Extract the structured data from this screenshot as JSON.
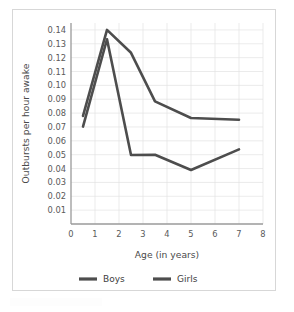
{
  "figure": {
    "border_color": "#d7d7d7",
    "background": "#ffffff"
  },
  "chart_data": {
    "type": "line",
    "title": "",
    "xlabel": "Age (in years)",
    "ylabel": "Outbursts per hour awake",
    "xlim": [
      0,
      8
    ],
    "ylim": [
      0,
      0.145
    ],
    "grid": true,
    "legend_position": "bottom",
    "x": [
      0.5,
      1.5,
      2.5,
      3.5,
      5,
      7
    ],
    "series": [
      {
        "name": "Boys",
        "color": "#4d4d4d",
        "values": [
          0.078,
          0.14,
          0.1235,
          0.0885,
          0.0765,
          0.0752
        ]
      },
      {
        "name": "Girls",
        "color": "#4d4d4d",
        "values": [
          0.0703,
          0.1333,
          0.0498,
          0.05,
          0.039,
          0.0538
        ]
      }
    ],
    "xticks": [
      "0",
      "1",
      "2",
      "3",
      "4",
      "5",
      "6",
      "7",
      "8"
    ],
    "xtick_values": [
      0,
      1,
      2,
      3,
      4,
      5,
      6,
      7,
      8
    ],
    "yticks": [
      "0.01",
      "0.02",
      "0.03",
      "0.04",
      "0.05",
      "0.06",
      "0.07",
      "0.08",
      "0.09",
      "0.10",
      "0.11",
      "0.12",
      "0.13",
      "0.14"
    ],
    "ytick_values": [
      0.01,
      0.02,
      0.03,
      0.04,
      0.05,
      0.06,
      0.07,
      0.08,
      0.09,
      0.1,
      0.11,
      0.12,
      0.13,
      0.14
    ]
  },
  "legend": {
    "items": [
      {
        "label": "Boys",
        "color": "#4d4d4d"
      },
      {
        "label": "Girls",
        "color": "#4d4d4d"
      }
    ]
  }
}
